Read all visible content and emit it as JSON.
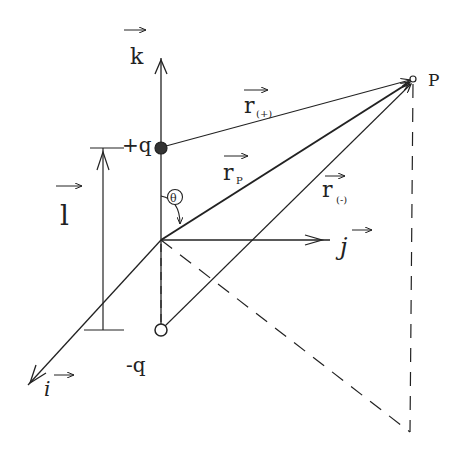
{
  "diagram": {
    "axes": {
      "k": {
        "label": "k",
        "vector": true
      },
      "j": {
        "label": "j",
        "vector": true
      },
      "i": {
        "label": "i",
        "vector": true
      }
    },
    "charges": {
      "positive": {
        "label": "+q",
        "style": "filled"
      },
      "negative": {
        "label": "-q",
        "style": "open"
      }
    },
    "point": {
      "label": "P"
    },
    "vectors": {
      "r_plus": {
        "main": "r",
        "sub": "(+)"
      },
      "r_p": {
        "main": "r",
        "sub": "P"
      },
      "r_minus": {
        "main": "r",
        "sub": "(-)"
      },
      "l": {
        "label": "l"
      }
    },
    "angle": {
      "label": "θ"
    },
    "colors": {
      "ink": "#222222",
      "background": "#ffffff"
    }
  }
}
